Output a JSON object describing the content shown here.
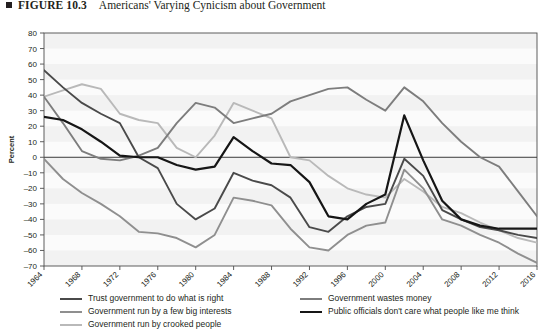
{
  "figure": {
    "number_label": "FIGURE 10.3",
    "caption": "Americans' Varying Cynicism about Government"
  },
  "chart_data": {
    "type": "line",
    "title": "Americans' Varying Cynicism about Government",
    "xlabel": "",
    "ylabel": "Percent",
    "xlim": [
      1964,
      2016
    ],
    "ylim": [
      -70,
      80
    ],
    "ytick_step": 10,
    "grid": false,
    "legend_position": "bottom",
    "x": [
      1964,
      1966,
      1968,
      1970,
      1972,
      1974,
      1976,
      1978,
      1980,
      1982,
      1984,
      1986,
      1988,
      1990,
      1992,
      1994,
      1996,
      1998,
      2000,
      2002,
      2004,
      2006,
      2008,
      2010,
      2012,
      2014,
      2016
    ],
    "ticks": {
      "y": [
        80,
        70,
        60,
        50,
        40,
        30,
        20,
        10,
        0,
        -10,
        -20,
        -30,
        -40,
        -50,
        -60,
        -70
      ],
      "x": [
        1964,
        1968,
        1972,
        1976,
        1980,
        1984,
        1988,
        1992,
        1996,
        2000,
        2004,
        2008,
        2012,
        2016
      ]
    },
    "series": [
      {
        "name": "Trust government to do what is right",
        "color": "#4a4a4a",
        "width": 1.9,
        "values": [
          56,
          45,
          35,
          28,
          22,
          0,
          -7,
          -30,
          -40,
          -33,
          -10,
          -15,
          -18,
          -26,
          -45,
          -48,
          -38,
          -32,
          -30,
          -1,
          -12,
          -34,
          -40,
          -45,
          -47,
          -50,
          -52
        ]
      },
      {
        "name": "Government run by a few big interests",
        "color": "#8f8f8f",
        "width": 1.9,
        "values": [
          -1,
          -14,
          -23,
          -30,
          -38,
          -48,
          -49,
          -52,
          -58,
          -50,
          -26,
          -28,
          -31,
          -46,
          -58,
          -60,
          -50,
          -44,
          -42,
          -8,
          -20,
          -40,
          -44,
          -50,
          -55,
          -62,
          -68
        ]
      },
      {
        "name": "Government run by crooked people",
        "color": "#b9b9b9",
        "width": 1.9,
        "values": [
          39,
          43,
          47,
          44,
          28,
          24,
          22,
          6,
          0,
          14,
          35,
          30,
          25,
          0,
          -2,
          -12,
          -20,
          -24,
          -26,
          -14,
          -22,
          -32,
          -36,
          -42,
          -47,
          -52,
          -55
        ]
      },
      {
        "name": "Government wastes money",
        "color": "#7d7d7d",
        "width": 1.9,
        "values": [
          39,
          22,
          4,
          -1,
          -2,
          1,
          6,
          22,
          35,
          32,
          22,
          25,
          28,
          36,
          40,
          44,
          45,
          37,
          30,
          45,
          36,
          22,
          10,
          0,
          -6,
          -22,
          -38
        ]
      },
      {
        "name": "Public officials don't care what people like me think",
        "color": "#161616",
        "width": 2.2,
        "values": [
          26,
          24,
          18,
          10,
          1,
          0,
          0,
          -5,
          -8,
          -6,
          13,
          4,
          -4,
          -5,
          -16,
          -38,
          -40,
          -30,
          -24,
          27,
          -2,
          -28,
          -40,
          -44,
          -46,
          -46,
          -46
        ]
      }
    ]
  },
  "legend": {
    "left_items": [
      {
        "label": "Trust government to do what is right",
        "color": "#4a4a4a"
      },
      {
        "label": "Government run by a few big interests",
        "color": "#8f8f8f"
      },
      {
        "label": "Government run by crooked people",
        "color": "#b9b9b9"
      }
    ],
    "right_items": [
      {
        "label": "Government wastes money",
        "color": "#7d7d7d"
      },
      {
        "label": "Public officials don't care what people like me think",
        "color": "#161616"
      }
    ]
  }
}
